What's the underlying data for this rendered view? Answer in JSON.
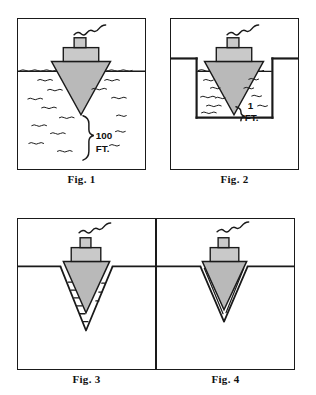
{
  "document": {
    "kind": "patent-style line drawing",
    "panel_count": 4,
    "background_color": "#ffffff",
    "ink_color": "#1a1a1a",
    "hull_fill_color": "#b9b9b9",
    "deck_fill_color": "#c9c9c9"
  },
  "figures": [
    {
      "id": "fig1",
      "caption": "Fig. 1",
      "scene": "ship floating in deep open water",
      "annotations": [
        {
          "name": "depth-callout-value",
          "text": "100"
        },
        {
          "name": "depth-callout-unit",
          "text": "FT."
        }
      ],
      "elements": {
        "vessel": "ship-with-conical-hull",
        "smoke": "wavy-smoke-trail",
        "water": "waterline-with-wave-ticks",
        "brace": "depth-brace-bracket"
      }
    },
    {
      "id": "fig2",
      "caption": "Fig. 2",
      "scene": "ship floating in a shallow rectangular basin",
      "annotations": [
        {
          "name": "depth-callout-value",
          "text": "1"
        },
        {
          "name": "depth-callout-unit",
          "text": "FT."
        }
      ],
      "elements": {
        "vessel": "ship-with-conical-hull",
        "smoke": "wavy-smoke-trail",
        "water": "waterline-with-wave-ticks",
        "basin": "rectangular-trench-walls",
        "brace": "depth-brace-bracket"
      }
    },
    {
      "id": "fig3",
      "caption": "Fig. 3",
      "scene": "conical hull seated in a wide V-shaped trench with water gap",
      "annotations": [],
      "elements": {
        "vessel": "ship-with-conical-hull",
        "smoke": "wavy-smoke-trail",
        "ground": "ground-line",
        "trench": "v-trench-wide",
        "gap": "water-gap-with-dashes"
      }
    },
    {
      "id": "fig4",
      "caption": "Fig. 4",
      "scene": "conical hull seated tightly in a narrow V-shaped trench",
      "annotations": [],
      "elements": {
        "vessel": "ship-with-conical-hull",
        "smoke": "wavy-smoke-trail",
        "ground": "ground-line",
        "trench": "v-trench-narrow",
        "gap": "thin-water-gap"
      }
    }
  ]
}
